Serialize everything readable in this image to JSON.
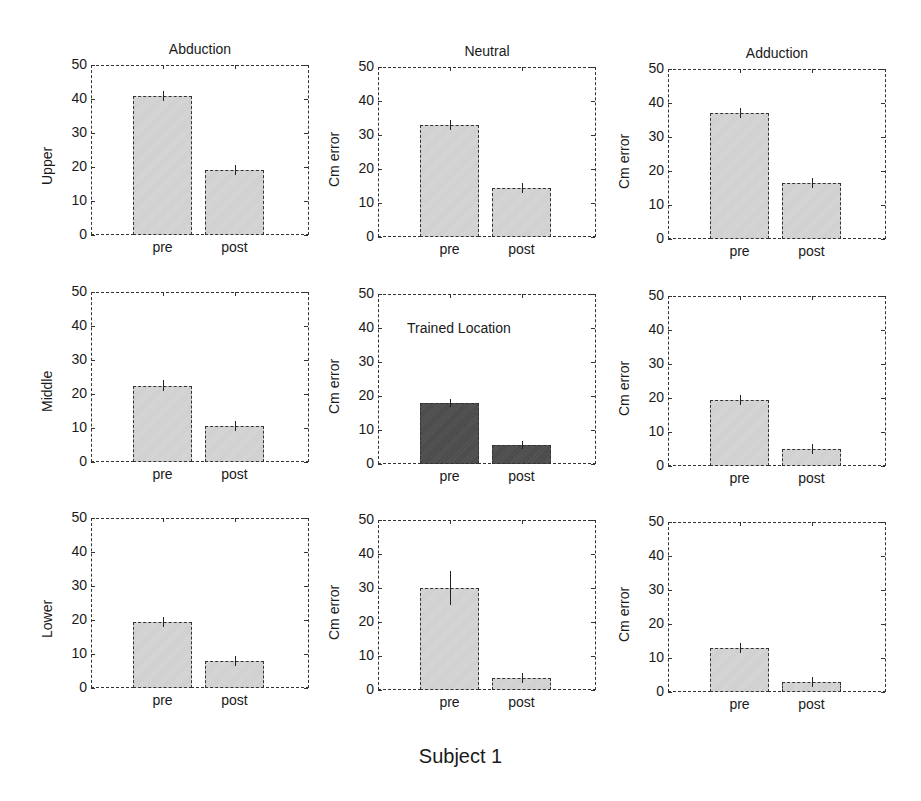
{
  "figure": {
    "footer": "Subject 1",
    "column_titles": [
      "Abduction",
      "Neutral",
      "Adduction"
    ],
    "row_labels": [
      "Upper",
      "Middle",
      "Lower"
    ]
  },
  "chart_data": [
    {
      "type": "bar",
      "row": 0,
      "col": 0,
      "title": "Abduction",
      "ylabel": "Upper",
      "categories": [
        "pre",
        "post"
      ],
      "values": [
        41,
        19
      ],
      "errors": [
        1.5,
        1.5
      ],
      "ylim": [
        0,
        50
      ],
      "yticks": [
        0,
        10,
        20,
        30,
        40,
        50
      ],
      "highlight": false
    },
    {
      "type": "bar",
      "row": 0,
      "col": 1,
      "title": "Neutral",
      "ylabel": "Cm error",
      "categories": [
        "pre",
        "post"
      ],
      "values": [
        33,
        14.5
      ],
      "errors": [
        1.5,
        1.5
      ],
      "ylim": [
        0,
        50
      ],
      "yticks": [
        0,
        10,
        20,
        30,
        40,
        50
      ],
      "highlight": false
    },
    {
      "type": "bar",
      "row": 0,
      "col": 2,
      "title": "Adduction",
      "ylabel": "Cm error",
      "categories": [
        "pre",
        "post"
      ],
      "values": [
        37,
        16.5
      ],
      "errors": [
        1.5,
        1.5
      ],
      "ylim": [
        0,
        50
      ],
      "yticks": [
        0,
        10,
        20,
        30,
        40,
        50
      ],
      "highlight": false
    },
    {
      "type": "bar",
      "row": 1,
      "col": 0,
      "title": "",
      "ylabel": "Middle",
      "categories": [
        "pre",
        "post"
      ],
      "values": [
        22.5,
        10.5
      ],
      "errors": [
        1.5,
        1.5
      ],
      "ylim": [
        0,
        50
      ],
      "yticks": [
        0,
        10,
        20,
        30,
        40,
        50
      ],
      "highlight": false
    },
    {
      "type": "bar",
      "row": 1,
      "col": 1,
      "title": "",
      "ylabel": "Cm error",
      "categories": [
        "pre",
        "post"
      ],
      "values": [
        18,
        5.5
      ],
      "errors": [
        1.2,
        1.2
      ],
      "ylim": [
        0,
        50
      ],
      "yticks": [
        0,
        10,
        20,
        30,
        40,
        50
      ],
      "highlight": true,
      "annotation": "Trained Location"
    },
    {
      "type": "bar",
      "row": 1,
      "col": 2,
      "title": "",
      "ylabel": "Cm error",
      "categories": [
        "pre",
        "post"
      ],
      "values": [
        19.5,
        5
      ],
      "errors": [
        1.5,
        1.5
      ],
      "ylim": [
        0,
        50
      ],
      "yticks": [
        0,
        10,
        20,
        30,
        40,
        50
      ],
      "highlight": false
    },
    {
      "type": "bar",
      "row": 2,
      "col": 0,
      "title": "",
      "ylabel": "Lower",
      "categories": [
        "pre",
        "post"
      ],
      "values": [
        19.5,
        8
      ],
      "errors": [
        1.5,
        1.5
      ],
      "ylim": [
        0,
        50
      ],
      "yticks": [
        0,
        10,
        20,
        30,
        40,
        50
      ],
      "highlight": false
    },
    {
      "type": "bar",
      "row": 2,
      "col": 1,
      "title": "",
      "ylabel": "Cm error",
      "categories": [
        "pre",
        "post"
      ],
      "values": [
        30,
        3.5
      ],
      "errors": [
        5,
        1.5
      ],
      "ylim": [
        0,
        50
      ],
      "yticks": [
        0,
        10,
        20,
        30,
        40,
        50
      ],
      "highlight": false
    },
    {
      "type": "bar",
      "row": 2,
      "col": 2,
      "title": "",
      "ylabel": "Cm error",
      "categories": [
        "pre",
        "post"
      ],
      "values": [
        13,
        3
      ],
      "errors": [
        1.5,
        1.5
      ],
      "ylim": [
        0,
        50
      ],
      "yticks": [
        0,
        10,
        20,
        30,
        40,
        50
      ],
      "highlight": false
    }
  ]
}
